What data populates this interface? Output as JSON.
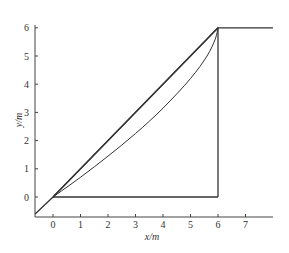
{
  "chart_data": {
    "type": "line",
    "title": "",
    "xlabel": "x/m",
    "ylabel": "y/m",
    "xlim": [
      -0.65,
      8.0
    ],
    "ylim": [
      -0.7,
      6.1
    ],
    "xticks": [
      0,
      1,
      2,
      3,
      4,
      5,
      6,
      7
    ],
    "yticks": [
      0,
      1,
      2,
      3,
      4,
      5,
      6
    ],
    "x_tick_labels": [
      "0",
      "1",
      "2",
      "3",
      "4",
      "5",
      "6",
      "7"
    ],
    "y_tick_labels": [
      "0",
      "1",
      "2",
      "3",
      "4",
      "5",
      "6"
    ],
    "grid": false,
    "legend": "none",
    "series": [
      {
        "name": "diagonal-line",
        "style": "straight",
        "points": [
          [
            -0.65,
            -0.6
          ],
          [
            0,
            0
          ],
          [
            6,
            6
          ]
        ]
      },
      {
        "name": "chord-line",
        "style": "straight",
        "points": [
          [
            0,
            0
          ],
          [
            6,
            6
          ]
        ]
      },
      {
        "name": "curved-path",
        "style": "curve",
        "points": [
          [
            0,
            0
          ],
          [
            1,
            0.7
          ],
          [
            2,
            1.45
          ],
          [
            3,
            2.25
          ],
          [
            4,
            3.15
          ],
          [
            5,
            4.2
          ],
          [
            5.6,
            5.0
          ],
          [
            5.9,
            5.6
          ],
          [
            6,
            6
          ]
        ]
      },
      {
        "name": "upper-horizontal",
        "style": "straight",
        "points": [
          [
            6,
            6
          ],
          [
            8.0,
            6
          ]
        ]
      },
      {
        "name": "vertical-segment",
        "style": "straight",
        "points": [
          [
            6,
            6
          ],
          [
            6,
            0
          ]
        ]
      },
      {
        "name": "bottom-horizontal",
        "style": "straight",
        "points": [
          [
            0,
            0
          ],
          [
            6,
            0
          ]
        ]
      }
    ]
  }
}
